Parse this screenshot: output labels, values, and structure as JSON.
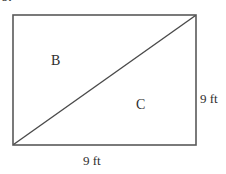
{
  "figure": {
    "problem_number": "5.",
    "shape": "rectangle-with-diagonal",
    "stroke_color": "#595959",
    "diagonal_color": "#4a4a4a",
    "background_color": "#ffffff",
    "regions": [
      {
        "id": "B",
        "label": "B",
        "position": "upper-left-triangle"
      },
      {
        "id": "C",
        "label": "C",
        "position": "lower-right-triangle"
      }
    ],
    "dimensions": [
      {
        "id": "bottom",
        "label": "9 ft",
        "value": 9,
        "unit": "ft",
        "side": "bottom"
      },
      {
        "id": "right",
        "label": "9 ft",
        "value": 9,
        "unit": "ft",
        "side": "right"
      }
    ],
    "geometry": {
      "rect_left": 13,
      "rect_top": 15,
      "rect_right": 196,
      "rect_bottom": 145,
      "diagonal_from": "bottom-left",
      "diagonal_to": "top-right"
    }
  }
}
